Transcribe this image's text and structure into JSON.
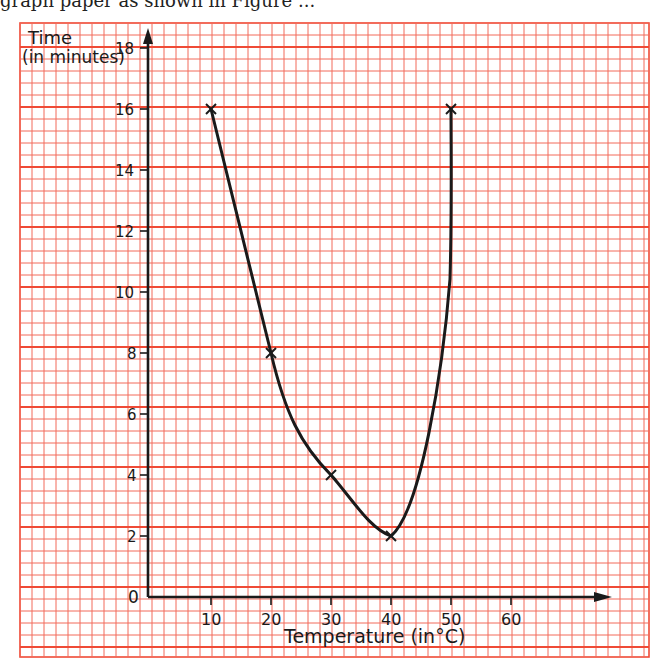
{
  "caption": "graph paper as shown in Figure ...",
  "chart_data": {
    "type": "line",
    "title": "",
    "xlabel": "Temperature (in°C)",
    "ylabel": "Time (in minutes)",
    "ylabel_lines": [
      "Time",
      "(in minutes)"
    ],
    "x_ticks": [
      10,
      20,
      30,
      40,
      50,
      60
    ],
    "y_ticks": [
      0,
      2,
      4,
      6,
      8,
      10,
      12,
      14,
      16,
      18
    ],
    "xlim": [
      0,
      75
    ],
    "ylim": [
      0,
      18.5
    ],
    "grid": true,
    "legend": null,
    "series": [
      {
        "name": "Time to react",
        "x": [
          10,
          20,
          30,
          40,
          50
        ],
        "y": [
          16,
          8,
          4,
          2,
          16
        ],
        "marker": "x",
        "smooth": true
      }
    ]
  },
  "colors": {
    "grid_minor": "#f26b5b",
    "grid_major": "#ef4a36",
    "ink": "#1a1a1a",
    "paper": "#ffffff"
  }
}
